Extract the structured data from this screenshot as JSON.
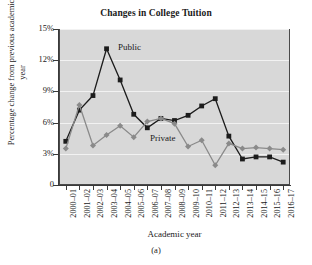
{
  "figure": {
    "caption": "(a)"
  },
  "chart_data": {
    "type": "line",
    "title": "Changes in College Tuition",
    "xlabel": "Academic year",
    "ylabel": "Percentage change from previous academic year",
    "grid": true,
    "legend_position": "inline-annotations",
    "ylim": [
      0,
      15
    ],
    "ytick_labels": [
      "0",
      "3%",
      "6%",
      "9%",
      "12%",
      "15%"
    ],
    "ytick_values": [
      0,
      3,
      6,
      9,
      12,
      15
    ],
    "categories": [
      "2000–01",
      "2001–02",
      "2002–03",
      "2003–04",
      "2004–05",
      "2005–06",
      "2006–07",
      "2007–08",
      "2008–09",
      "2009–10",
      "2010–11",
      "2011–12",
      "2012–13",
      "2013–14",
      "2014–15",
      "2015–16",
      "2016–17"
    ],
    "series": [
      {
        "name": "Public",
        "color": "#1c1c1c",
        "marker": "square",
        "values": [
          4.2,
          7.2,
          8.6,
          13.1,
          10.1,
          6.8,
          5.5,
          6.4,
          6.2,
          6.7,
          7.6,
          8.3,
          4.7,
          2.5,
          2.7,
          2.7,
          2.2
        ]
      },
      {
        "name": "Private",
        "color": "#8a8a8a",
        "marker": "diamond",
        "values": [
          3.5,
          7.7,
          3.8,
          4.8,
          5.7,
          4.6,
          6.1,
          6.4,
          5.9,
          3.7,
          4.3,
          1.9,
          4.0,
          3.5,
          3.6,
          3.5,
          3.4
        ]
      }
    ],
    "plot_background": "#d8d8d8",
    "gridline_color": "#f2f2f2",
    "axis_color": "#3a3a3a"
  }
}
